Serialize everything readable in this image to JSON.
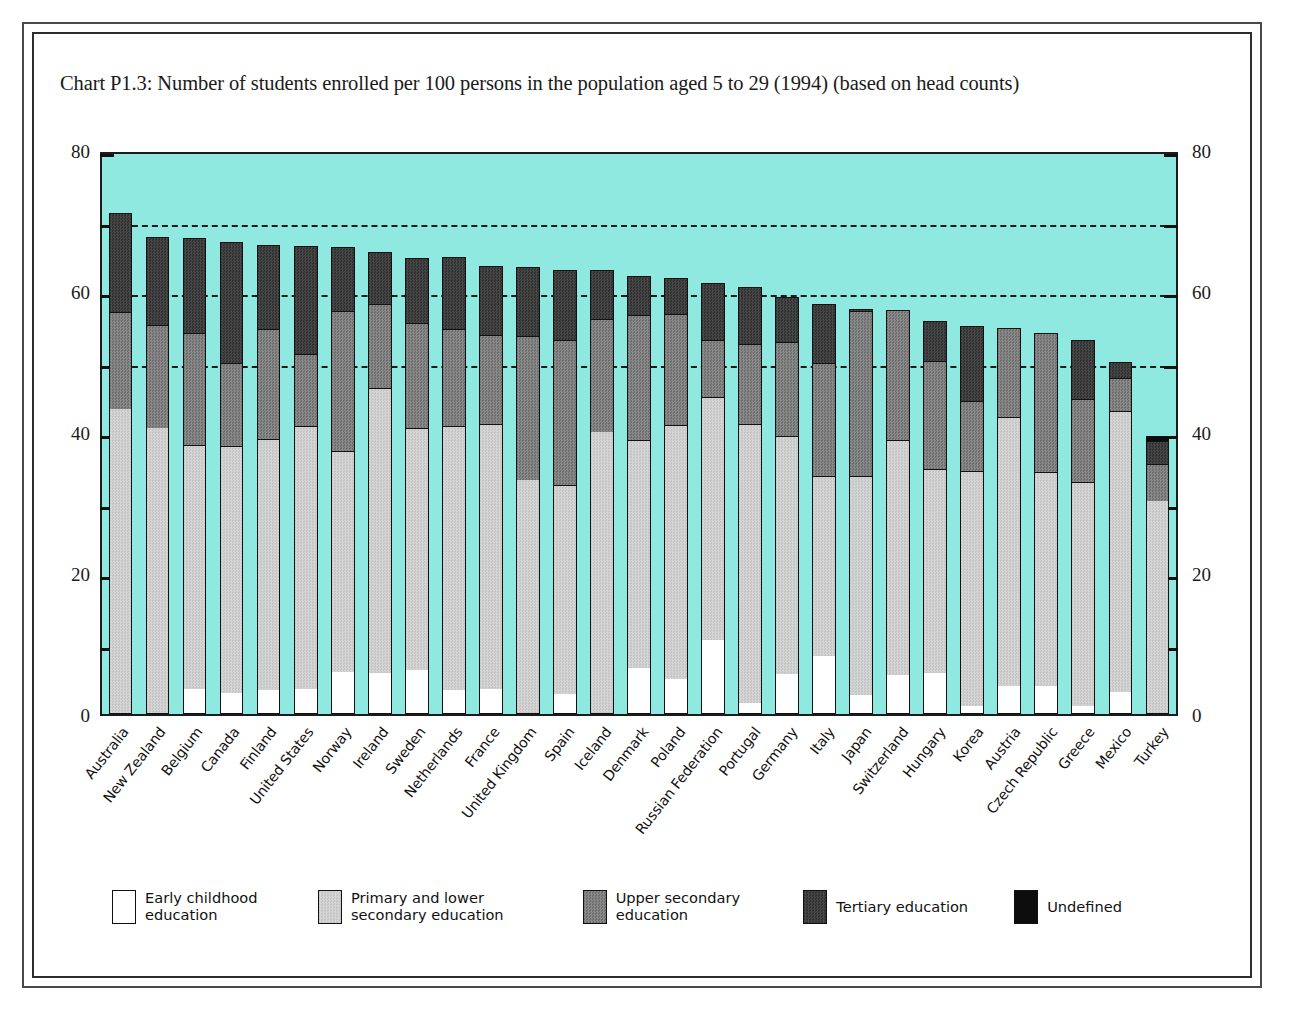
{
  "chart_title": "Chart P1.3: Number of  students enrolled per 100 persons in the population aged 5 to 29 (1994) (based on head counts)",
  "axis": {
    "y_major_labels": [
      "0",
      "20",
      "40",
      "60",
      "80"
    ],
    "y_major_values": [
      0,
      20,
      40,
      60,
      80
    ],
    "y_minor_values": [
      10,
      30,
      50,
      70
    ],
    "ymin": 0,
    "ymax": 80,
    "gridline_values": [
      50,
      60,
      70
    ]
  },
  "legend": {
    "items": [
      {
        "label": "Early childhood\neducation",
        "color": "#ffffff",
        "key": "early"
      },
      {
        "label": "Primary and lower\nsecondary education",
        "color": "#cfcfcf",
        "key": "primary"
      },
      {
        "label": "Upper secondary\neducation",
        "color": "#7d7d7d",
        "key": "upper"
      },
      {
        "label": "Tertiary education",
        "color": "#3c3c3c",
        "key": "tertiary"
      },
      {
        "label": "Undefined",
        "color": "#0d0d0d",
        "key": "undefined"
      }
    ]
  },
  "colors": {
    "plot_background": "#8fe9e1",
    "frame": "#2d2d2d",
    "axis": "#111111"
  },
  "chart_data": {
    "type": "bar",
    "subtype": "stacked-vertical",
    "title": "Chart P1.3: Number of  students enrolled per 100 persons in the population aged 5 to 29 (1994) (based on head counts)",
    "xlabel": "",
    "ylabel": "",
    "ylim": [
      0,
      80
    ],
    "grid": true,
    "legend_position": "bottom",
    "categories": [
      "Australia",
      "New Zealand",
      "Belgium",
      "Canada",
      "Finland",
      "United States",
      "Norway",
      "Ireland",
      "Sweden",
      "Netherlands",
      "France",
      "United Kingdom",
      "Spain",
      "Iceland",
      "Denmark",
      "Poland",
      "Russian Federation",
      "Portugal",
      "Germany",
      "Italy",
      "Japan",
      "Switzerland",
      "Hungary",
      "Korea",
      "Austria",
      "Czech Republic",
      "Greece",
      "Mexico",
      "Turkey"
    ],
    "series": [
      {
        "name": "Early childhood education",
        "key": "early",
        "color": "#ffffff",
        "values": [
          0.0,
          0.0,
          3.6,
          3.0,
          3.4,
          3.6,
          6.0,
          5.8,
          6.2,
          3.4,
          3.6,
          0.0,
          2.8,
          0.0,
          6.5,
          5.0,
          10.5,
          1.6,
          5.7,
          8.3,
          2.7,
          5.5,
          5.8,
          1.2,
          4.0,
          4.0,
          1.1,
          3.1,
          0.0
        ]
      },
      {
        "name": "Primary and lower secondary education",
        "key": "primary",
        "color": "#cfcfcf",
        "values": [
          43.2,
          40.5,
          34.5,
          35.0,
          35.6,
          37.3,
          31.3,
          40.5,
          34.3,
          37.4,
          37.6,
          33.2,
          29.7,
          40.0,
          32.4,
          36.0,
          34.4,
          39.6,
          33.7,
          25.5,
          31.0,
          33.3,
          28.9,
          33.3,
          38.2,
          30.4,
          31.8,
          39.9,
          30.2
        ]
      },
      {
        "name": "Upper secondary education",
        "key": "upper",
        "color": "#7d7d7d",
        "values": [
          13.8,
          14.7,
          15.9,
          11.8,
          15.6,
          10.1,
          19.9,
          11.8,
          14.9,
          13.8,
          12.6,
          20.4,
          20.6,
          16.1,
          17.7,
          15.7,
          8.1,
          11.3,
          13.4,
          16.0,
          23.5,
          18.5,
          15.4,
          9.9,
          12.6,
          19.6,
          11.8,
          4.6,
          5.2
        ]
      },
      {
        "name": "Tertiary education",
        "key": "tertiary",
        "color": "#3c3c3c",
        "values": [
          14.0,
          12.5,
          13.5,
          17.2,
          12.0,
          15.4,
          9.1,
          7.5,
          9.3,
          10.2,
          9.7,
          9.8,
          9.9,
          6.9,
          5.6,
          5.1,
          8.1,
          8.1,
          6.4,
          8.4,
          0.3,
          0.0,
          5.7,
          10.6,
          0.0,
          0.0,
          8.3,
          2.4,
          3.3
        ]
      },
      {
        "name": "Undefined",
        "key": "undefined",
        "color": "#0d0d0d",
        "values": [
          0.0,
          0.0,
          0.0,
          0.0,
          0.0,
          0.0,
          0.0,
          0.0,
          0.0,
          0.0,
          0.0,
          0.0,
          0.0,
          0.0,
          0.0,
          0.0,
          0.0,
          0.0,
          0.0,
          0.0,
          0.0,
          0.0,
          0.0,
          0.0,
          0.0,
          0.0,
          0.0,
          0.0,
          0.8
        ]
      }
    ],
    "totals": [
      71.0,
      67.7,
      67.5,
      67.0,
      66.6,
      66.4,
      66.3,
      65.6,
      64.7,
      64.8,
      63.5,
      63.4,
      63.0,
      63.0,
      62.2,
      61.8,
      61.1,
      60.6,
      59.2,
      58.2,
      57.5,
      57.3,
      55.8,
      55.0,
      54.8,
      54.0,
      53.0,
      50.0,
      39.5
    ]
  }
}
